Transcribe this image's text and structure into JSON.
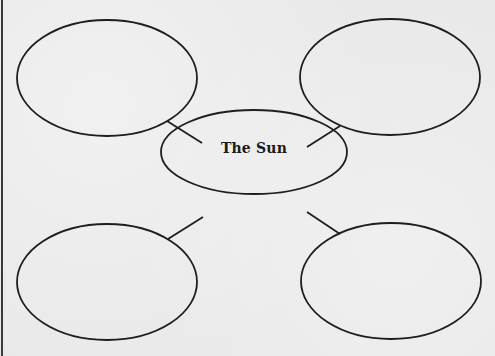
{
  "diagram": {
    "type": "concept-map",
    "center": {
      "label": "The Sun",
      "cx": 254,
      "cy": 152,
      "rx": 93,
      "ry": 42
    },
    "nodes": [
      {
        "id": "top-left",
        "label": "",
        "cx": 107,
        "cy": 78,
        "rx": 90,
        "ry": 58
      },
      {
        "id": "top-right",
        "label": "",
        "cx": 390,
        "cy": 77,
        "rx": 90,
        "ry": 58
      },
      {
        "id": "bottom-left",
        "label": "",
        "cx": 107,
        "cy": 282,
        "rx": 90,
        "ry": 58
      },
      {
        "id": "bottom-right",
        "label": "",
        "cx": 391,
        "cy": 281,
        "rx": 90,
        "ry": 58
      }
    ],
    "edges": [
      {
        "from": "center",
        "to": "top-left",
        "x1": 202,
        "y1": 143,
        "x2": 167,
        "y2": 121
      },
      {
        "from": "center",
        "to": "top-right",
        "x1": 307,
        "y1": 147,
        "x2": 340,
        "y2": 126
      },
      {
        "from": "center",
        "to": "bottom-left",
        "x1": 203,
        "y1": 217,
        "x2": 168,
        "y2": 239
      },
      {
        "from": "center",
        "to": "bottom-right",
        "x1": 307,
        "y1": 212,
        "x2": 340,
        "y2": 234
      }
    ],
    "colors": {
      "stroke": "#1e1e1e",
      "paper": "#e9e9e9",
      "text": "#1a1a1a"
    }
  }
}
